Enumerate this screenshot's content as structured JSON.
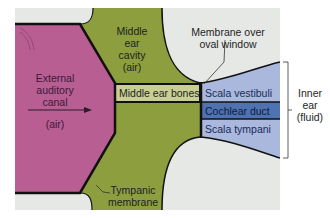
{
  "diagram": {
    "title": "",
    "colors": {
      "background": "#ffffff",
      "panel": "#e6e8e6",
      "external_canal": "#b85e92",
      "middle_ear": "#8c9e3e",
      "bones_box": "#c9cf92",
      "scala_light": "#a9b8dc",
      "cochlear_duct": "#4f73b0",
      "outline": "#111111"
    },
    "labels": {
      "external_canal": [
        "External",
        "auditory",
        "canal"
      ],
      "external_air": "(air)",
      "middle_ear_cavity": [
        "Middle",
        "ear",
        "cavity",
        "(air)"
      ],
      "membrane_oval": [
        "Membrane over",
        "oval window"
      ],
      "middle_ear_bones": "Middle ear bones",
      "scala_vestibuli": "Scala vestibuli",
      "cochlear_duct": "Cochlear duct",
      "scala_tympani": "Scala tympani",
      "inner_ear": [
        "Inner",
        "ear",
        "(fluid)"
      ],
      "tympanic_membrane": [
        "Tympanic",
        "membrane"
      ]
    }
  }
}
